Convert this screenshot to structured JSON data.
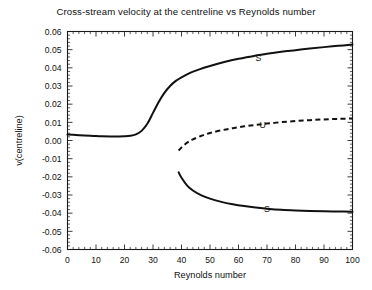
{
  "chart_data": {
    "type": "line",
    "title": "Cross-stream velocity at the centreline vs Reynolds number",
    "xlabel": "Reynolds number",
    "ylabel": "v(centreline)",
    "xlim": [
      0,
      100
    ],
    "ylim": [
      -0.06,
      0.06
    ],
    "grid": false,
    "legend": "none",
    "xticks": [
      0,
      10,
      20,
      30,
      40,
      50,
      60,
      70,
      80,
      90,
      100
    ],
    "xtick_labels": [
      "0",
      "10",
      "20",
      "30",
      "40",
      "50",
      "60",
      "70",
      "80",
      "90",
      "100"
    ],
    "yticks": [
      0.06,
      0.05,
      0.04,
      0.03,
      0.02,
      0.01,
      0.0,
      -0.01,
      -0.02,
      -0.03,
      -0.04,
      -0.05,
      -0.06
    ],
    "ytick_labels": [
      "0.06",
      "0.05",
      "0.04",
      "0.03",
      "0.02",
      "0.01",
      "0.00",
      "-0.01",
      "-0.02",
      "-0.03",
      "-0.04",
      "-0.05",
      "-0.06"
    ],
    "minor_ticks_per_interval": 5,
    "series": [
      {
        "name": "upper-stable-branch",
        "style": "solid",
        "annotation": "S",
        "x": [
          0,
          3,
          6,
          9,
          12,
          15,
          18,
          20,
          22,
          24,
          26,
          28,
          30,
          32,
          34,
          36,
          38,
          40,
          43,
          46,
          50,
          55,
          60,
          65,
          70,
          75,
          80,
          85,
          90,
          95,
          100
        ],
        "y": [
          0.0033,
          0.003,
          0.0027,
          0.0025,
          0.0023,
          0.0022,
          0.0022,
          0.0023,
          0.0026,
          0.0034,
          0.0053,
          0.0092,
          0.0152,
          0.0212,
          0.0262,
          0.03,
          0.0328,
          0.0348,
          0.0372,
          0.039,
          0.041,
          0.0432,
          0.045,
          0.0464,
          0.0477,
          0.0488,
          0.0497,
          0.0506,
          0.0514,
          0.0521,
          0.0528
        ]
      },
      {
        "name": "unstable-branch",
        "style": "dashed",
        "annotation": "U",
        "x": [
          39,
          40,
          42,
          44,
          47,
          50,
          54,
          58,
          62,
          66,
          70,
          75,
          80,
          85,
          90,
          95,
          100
        ],
        "y": [
          -0.0055,
          -0.0038,
          -0.0012,
          0.0006,
          0.0026,
          0.0041,
          0.0056,
          0.0068,
          0.0078,
          0.0086,
          0.0093,
          0.0101,
          0.0107,
          0.0112,
          0.0116,
          0.0119,
          0.0121
        ]
      },
      {
        "name": "lower-stable-branch",
        "style": "solid",
        "annotation": "S",
        "x": [
          39,
          40,
          42,
          44,
          47,
          50,
          54,
          58,
          62,
          66,
          70,
          75,
          80,
          85,
          90,
          95,
          100
        ],
        "y": [
          -0.0175,
          -0.0205,
          -0.0248,
          -0.0275,
          -0.0302,
          -0.032,
          -0.0338,
          -0.0351,
          -0.0361,
          -0.0369,
          -0.0375,
          -0.0381,
          -0.0385,
          -0.0388,
          -0.039,
          -0.0391,
          -0.0392
        ]
      }
    ],
    "annotations": [
      {
        "text": "S",
        "x": 67,
        "y": 0.0455,
        "series": "upper-stable-branch"
      },
      {
        "text": "U",
        "x": 68.5,
        "y": 0.0085,
        "series": "unstable-branch"
      },
      {
        "text": "S",
        "x": 70,
        "y": -0.0375,
        "series": "lower-stable-branch"
      }
    ]
  },
  "colors": {
    "curve": "#111111",
    "axis": "#1a1a1a",
    "background": "#ffffff"
  }
}
